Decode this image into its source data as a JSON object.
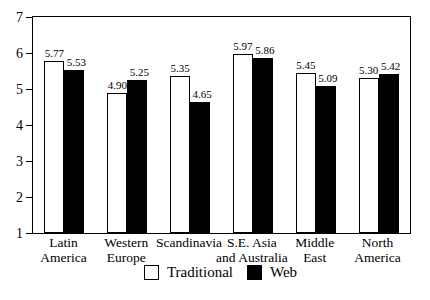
{
  "chart_data": {
    "type": "bar",
    "title": "",
    "xlabel": "",
    "ylabel": "",
    "categories": [
      "Latin\nAmerica",
      "Western\nEurope",
      "Scandinavia",
      "S.E. Asia\nand Australia",
      "Middle\nEast",
      "North\nAmerica"
    ],
    "series": [
      {
        "name": "Traditional",
        "fill": "#ffffff",
        "values": [
          5.77,
          4.9,
          5.35,
          5.97,
          5.45,
          5.3
        ]
      },
      {
        "name": "Web",
        "fill": "#000000",
        "values": [
          5.53,
          5.25,
          4.65,
          5.86,
          5.09,
          5.42
        ]
      }
    ],
    "value_labels_shown": true,
    "value_label_format": "0.00",
    "ylim": [
      1,
      7
    ],
    "yticks": [
      1,
      2,
      3,
      4,
      5,
      6,
      7
    ],
    "grid": false,
    "legend_position": "bottom-center",
    "bar_border_color": "#000000",
    "axis_color": "#000000",
    "background_color": "#ffffff"
  }
}
